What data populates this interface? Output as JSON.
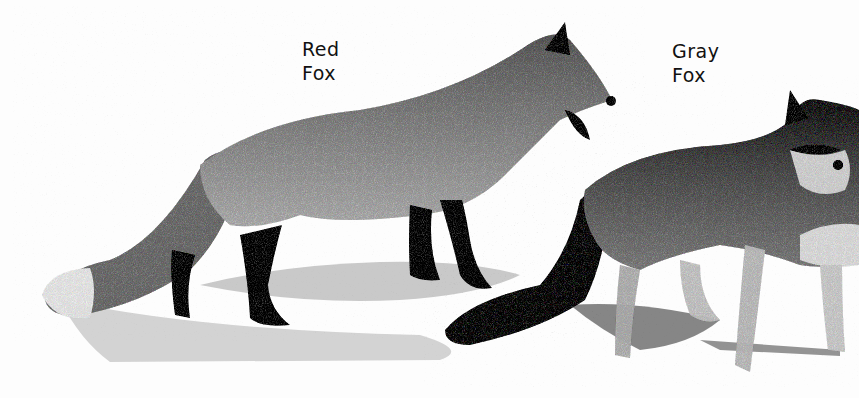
{
  "illustration": {
    "labels": {
      "red_fox": {
        "line1": "Red",
        "line2": "Fox"
      },
      "gray_fox": {
        "line1": "Gray",
        "line2": "Fox"
      }
    },
    "colors": {
      "background": "#fdfdfd",
      "fur_mid": "#8a8a8a",
      "fur_dark": "#2a2a2a",
      "shadow": "#b5b5b5",
      "text": "#111111"
    }
  }
}
